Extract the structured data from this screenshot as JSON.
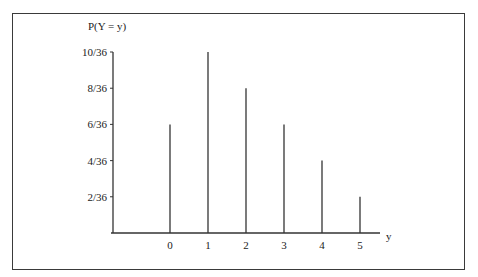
{
  "chart_data": {
    "type": "bar",
    "style": "stem (vertical line) plot",
    "title": "",
    "ylabel": "P(Y = y)",
    "xlabel": "y",
    "categories": [
      "0",
      "1",
      "2",
      "3",
      "4",
      "5"
    ],
    "x": [
      0,
      1,
      2,
      3,
      4,
      5
    ],
    "values": [
      0.1667,
      0.2778,
      0.2222,
      0.1667,
      0.1111,
      0.0556
    ],
    "value_labels": [
      "6/36",
      "10/36",
      "8/36",
      "6/36",
      "4/36",
      "2/36"
    ],
    "y_ticks": [
      "2/36",
      "4/36",
      "6/36",
      "8/36",
      "10/36"
    ],
    "y_tick_values": [
      0.0556,
      0.1111,
      0.1667,
      0.2222,
      0.2778
    ],
    "x_ticks": [
      "0",
      "1",
      "2",
      "3",
      "4",
      "5"
    ],
    "ylim": [
      0,
      0.2778
    ],
    "grid": false,
    "legend": null
  },
  "labels": {
    "ylabel": "P(Y = y)",
    "xlabel": "y"
  },
  "colors": {
    "line": "#333333",
    "frame": "#3a3a3a",
    "background": "#ffffff"
  }
}
